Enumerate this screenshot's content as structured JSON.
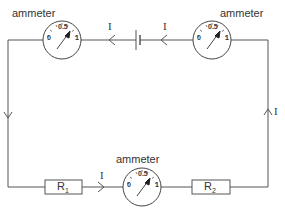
{
  "diagram": {
    "type": "series circuit",
    "ammeters": [
      {
        "id": "top-left",
        "label": "ammeter",
        "scale": [
          "0",
          "0.5",
          "1"
        ]
      },
      {
        "id": "top-right",
        "label": "ammeter",
        "scale": [
          "0",
          "0.5",
          "1"
        ]
      },
      {
        "id": "bottom",
        "label": "ammeter",
        "scale": [
          "0",
          "0.5",
          "1"
        ]
      }
    ],
    "resistors": [
      {
        "id": "R1",
        "label": "R",
        "subscript": "1"
      },
      {
        "id": "R2",
        "label": "R",
        "subscript": "2"
      }
    ],
    "current_labels": {
      "top_left": "I",
      "top_right": "I",
      "bottom": "I",
      "right": "I"
    },
    "colors": {
      "wire": "#555555",
      "background": "#ffffff"
    }
  }
}
